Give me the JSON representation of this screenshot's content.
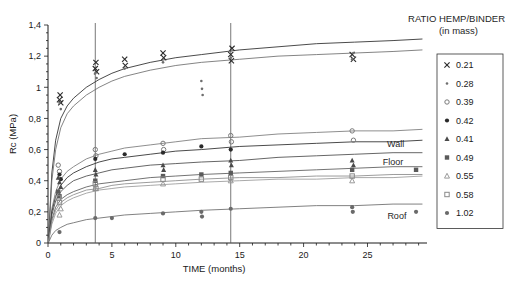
{
  "chart_data": {
    "type": "line",
    "title": "RATIO HEMP/BINDER",
    "subtitle": "(in mass)",
    "xlabel": "TIME (months)",
    "ylabel": "Rc (MPa)",
    "xlim": [
      0,
      29.5
    ],
    "ylim": [
      0,
      1.4
    ],
    "xticks": [
      0,
      5,
      10,
      15,
      20,
      25
    ],
    "xtick_labels": [
      "0",
      "5",
      "10",
      "15",
      "20",
      "25"
    ],
    "xtick_step_minor": 1,
    "yticks": [
      0,
      0.2,
      0.4,
      0.6,
      0.8,
      1.0,
      1.2,
      1.4
    ],
    "ytick_labels": [
      "0",
      "0,2",
      "0,4",
      "0,6",
      "0,8",
      "1",
      "1,2",
      "1,4"
    ],
    "grid": false,
    "legend_position": "right",
    "legend_title": "RATIO HEMP/BINDER (in mass)",
    "vertical_reference_lines": [
      3.7,
      14.3
    ],
    "annotations": [
      {
        "text": "Wall",
        "x": 27.2,
        "y": 0.615
      },
      {
        "text": "Floor",
        "x": 27.0,
        "y": 0.5
      },
      {
        "text": "Roof",
        "x": 27.3,
        "y": 0.155
      }
    ],
    "series": [
      {
        "name": "0.21",
        "marker": "cross",
        "color": "#2a2a2a",
        "curve": [
          [
            0.05,
            0.04
          ],
          [
            0.3,
            0.45
          ],
          [
            0.6,
            0.66
          ],
          [
            1.0,
            0.8
          ],
          [
            1.5,
            0.88
          ],
          [
            2,
            0.93
          ],
          [
            3,
            1.0
          ],
          [
            4,
            1.05
          ],
          [
            5,
            1.09
          ],
          [
            6,
            1.12
          ],
          [
            8,
            1.16
          ],
          [
            10,
            1.19
          ],
          [
            12,
            1.21
          ],
          [
            15,
            1.24
          ],
          [
            18,
            1.26
          ],
          [
            21,
            1.28
          ],
          [
            24,
            1.29
          ],
          [
            27,
            1.3
          ],
          [
            29.3,
            1.31
          ]
        ],
        "points": [
          [
            0.9,
            0.92
          ],
          [
            0.95,
            0.95
          ],
          [
            1.0,
            0.9
          ],
          [
            3.7,
            1.12
          ],
          [
            3.75,
            1.16
          ],
          [
            3.8,
            1.1
          ],
          [
            6.0,
            1.18
          ],
          [
            6.05,
            1.14
          ],
          [
            9.0,
            1.22
          ],
          [
            9.05,
            1.19
          ],
          [
            14.3,
            1.21
          ],
          [
            14.35,
            1.17
          ],
          [
            14.4,
            1.25
          ],
          [
            23.8,
            1.21
          ],
          [
            23.9,
            1.18
          ]
        ]
      },
      {
        "name": "0.28",
        "marker": "dot-small",
        "color": "#6e6e6e",
        "curve": [
          [
            0.05,
            0.03
          ],
          [
            0.3,
            0.4
          ],
          [
            0.6,
            0.6
          ],
          [
            1.0,
            0.74
          ],
          [
            1.5,
            0.83
          ],
          [
            2,
            0.88
          ],
          [
            3,
            0.95
          ],
          [
            4,
            1.0
          ],
          [
            5,
            1.04
          ],
          [
            6,
            1.07
          ],
          [
            8,
            1.11
          ],
          [
            10,
            1.14
          ],
          [
            12,
            1.16
          ],
          [
            15,
            1.18
          ],
          [
            18,
            1.2
          ],
          [
            21,
            1.21
          ],
          [
            24,
            1.22
          ],
          [
            27,
            1.23
          ],
          [
            29.3,
            1.24
          ]
        ],
        "points": [
          [
            0.9,
            0.9
          ],
          [
            1.0,
            0.86
          ],
          [
            3.7,
            1.09
          ],
          [
            3.8,
            1.06
          ],
          [
            6.0,
            1.12
          ],
          [
            9.0,
            1.16
          ],
          [
            12.0,
            1.04
          ],
          [
            12.05,
            0.99
          ],
          [
            12.1,
            0.95
          ],
          [
            14.3,
            1.19
          ],
          [
            23.8,
            1.18
          ],
          [
            23.9,
            1.22
          ]
        ]
      },
      {
        "name": "0.39",
        "marker": "circle-open",
        "color": "#7a7a7a",
        "curve": [
          [
            0.05,
            0.02
          ],
          [
            0.3,
            0.22
          ],
          [
            0.6,
            0.33
          ],
          [
            1.0,
            0.41
          ],
          [
            1.5,
            0.46
          ],
          [
            2,
            0.49
          ],
          [
            3,
            0.54
          ],
          [
            4,
            0.57
          ],
          [
            5,
            0.59
          ],
          [
            6,
            0.61
          ],
          [
            8,
            0.63
          ],
          [
            10,
            0.65
          ],
          [
            12,
            0.67
          ],
          [
            15,
            0.68
          ],
          [
            18,
            0.7
          ],
          [
            21,
            0.71
          ],
          [
            24,
            0.72
          ],
          [
            27,
            0.72
          ],
          [
            29.3,
            0.73
          ]
        ],
        "points": [
          [
            0.8,
            0.5
          ],
          [
            0.9,
            0.46
          ],
          [
            3.7,
            0.6
          ],
          [
            3.75,
            0.56
          ],
          [
            9.0,
            0.64
          ],
          [
            9.05,
            0.6
          ],
          [
            14.3,
            0.69
          ],
          [
            14.35,
            0.65
          ],
          [
            23.8,
            0.72
          ],
          [
            23.9,
            0.66
          ]
        ]
      },
      {
        "name": "0.42",
        "marker": "dot-filled",
        "color": "#2a2a2a",
        "curve": [
          [
            0.05,
            0.02
          ],
          [
            0.3,
            0.2
          ],
          [
            0.6,
            0.3
          ],
          [
            1.0,
            0.37
          ],
          [
            1.5,
            0.42
          ],
          [
            2,
            0.45
          ],
          [
            3,
            0.49
          ],
          [
            4,
            0.52
          ],
          [
            5,
            0.54
          ],
          [
            6,
            0.55
          ],
          [
            8,
            0.57
          ],
          [
            10,
            0.59
          ],
          [
            12,
            0.6
          ],
          [
            15,
            0.62
          ],
          [
            18,
            0.63
          ],
          [
            21,
            0.64
          ],
          [
            24,
            0.65
          ],
          [
            27,
            0.65
          ],
          [
            29.3,
            0.66
          ]
        ],
        "points": [
          [
            0.9,
            0.44
          ],
          [
            1.0,
            0.41
          ],
          [
            3.7,
            0.54
          ],
          [
            6.0,
            0.57
          ],
          [
            9.0,
            0.58
          ],
          [
            12.0,
            0.62
          ],
          [
            14.3,
            0.6
          ]
        ]
      },
      {
        "name": "0.41",
        "marker": "triangle-filled",
        "color": "#4a4a4a",
        "curve": [
          [
            0.05,
            0.02
          ],
          [
            0.3,
            0.18
          ],
          [
            0.6,
            0.27
          ],
          [
            1.0,
            0.33
          ],
          [
            1.5,
            0.37
          ],
          [
            2,
            0.4
          ],
          [
            3,
            0.43
          ],
          [
            4,
            0.45
          ],
          [
            5,
            0.47
          ],
          [
            6,
            0.48
          ],
          [
            8,
            0.5
          ],
          [
            10,
            0.51
          ],
          [
            12,
            0.52
          ],
          [
            15,
            0.53
          ],
          [
            18,
            0.55
          ],
          [
            21,
            0.56
          ],
          [
            24,
            0.57
          ],
          [
            27,
            0.58
          ],
          [
            29.3,
            0.58
          ]
        ],
        "points": [
          [
            0.8,
            0.42
          ],
          [
            0.9,
            0.39
          ],
          [
            1.0,
            0.36
          ],
          [
            3.7,
            0.47
          ],
          [
            3.75,
            0.44
          ],
          [
            9.0,
            0.5
          ],
          [
            9.05,
            0.47
          ],
          [
            14.3,
            0.53
          ],
          [
            14.35,
            0.5
          ],
          [
            23.8,
            0.53
          ],
          [
            23.9,
            0.5
          ]
        ]
      },
      {
        "name": "0.49",
        "marker": "square-filled",
        "color": "#5a5a5a",
        "curve": [
          [
            0.05,
            0.015
          ],
          [
            0.3,
            0.15
          ],
          [
            0.6,
            0.23
          ],
          [
            1.0,
            0.28
          ],
          [
            1.5,
            0.31
          ],
          [
            2,
            0.33
          ],
          [
            3,
            0.36
          ],
          [
            4,
            0.38
          ],
          [
            5,
            0.39
          ],
          [
            6,
            0.4
          ],
          [
            8,
            0.42
          ],
          [
            10,
            0.43
          ],
          [
            12,
            0.44
          ],
          [
            15,
            0.45
          ],
          [
            18,
            0.46
          ],
          [
            21,
            0.47
          ],
          [
            24,
            0.48
          ],
          [
            27,
            0.49
          ],
          [
            29.3,
            0.49
          ]
        ],
        "points": [
          [
            0.8,
            0.33
          ],
          [
            0.9,
            0.3
          ],
          [
            3.7,
            0.4
          ],
          [
            9.0,
            0.43
          ],
          [
            12.0,
            0.44
          ],
          [
            14.3,
            0.45
          ],
          [
            23.8,
            0.47
          ],
          [
            28.8,
            0.47
          ]
        ]
      },
      {
        "name": "0.55",
        "marker": "triangle-open",
        "color": "#9a9a9a",
        "curve": [
          [
            0.05,
            0.01
          ],
          [
            0.3,
            0.12
          ],
          [
            0.6,
            0.19
          ],
          [
            1.0,
            0.24
          ],
          [
            1.5,
            0.27
          ],
          [
            2,
            0.29
          ],
          [
            3,
            0.32
          ],
          [
            4,
            0.34
          ],
          [
            5,
            0.35
          ],
          [
            6,
            0.36
          ],
          [
            8,
            0.37
          ],
          [
            10,
            0.38
          ],
          [
            12,
            0.39
          ],
          [
            15,
            0.4
          ],
          [
            18,
            0.41
          ],
          [
            21,
            0.41
          ],
          [
            24,
            0.42
          ],
          [
            27,
            0.42
          ],
          [
            29.3,
            0.43
          ]
        ],
        "points": [
          [
            0.9,
            0.18
          ],
          [
            1.0,
            0.22
          ],
          [
            3.7,
            0.35
          ],
          [
            9.0,
            0.38
          ],
          [
            14.3,
            0.4
          ],
          [
            23.8,
            0.4
          ]
        ]
      },
      {
        "name": "0.58",
        "marker": "square-open",
        "color": "#8a8a8a",
        "curve": [
          [
            0.05,
            0.012
          ],
          [
            0.3,
            0.14
          ],
          [
            0.6,
            0.21
          ],
          [
            1.0,
            0.26
          ],
          [
            1.5,
            0.29
          ],
          [
            2,
            0.31
          ],
          [
            3,
            0.34
          ],
          [
            4,
            0.35
          ],
          [
            5,
            0.37
          ],
          [
            6,
            0.38
          ],
          [
            8,
            0.39
          ],
          [
            10,
            0.4
          ],
          [
            12,
            0.41
          ],
          [
            15,
            0.42
          ],
          [
            18,
            0.42
          ],
          [
            21,
            0.43
          ],
          [
            24,
            0.43
          ],
          [
            27,
            0.44
          ],
          [
            29.3,
            0.44
          ]
        ],
        "points": [
          [
            0.8,
            0.29
          ],
          [
            0.9,
            0.26
          ],
          [
            3.7,
            0.38
          ],
          [
            3.75,
            0.35
          ],
          [
            9.0,
            0.41
          ],
          [
            12.0,
            0.41
          ],
          [
            14.3,
            0.42
          ],
          [
            23.8,
            0.43
          ]
        ]
      },
      {
        "name": "1.02",
        "marker": "dot-filled",
        "color": "#6a6a6a",
        "curve": [
          [
            0.05,
            0.005
          ],
          [
            0.3,
            0.05
          ],
          [
            0.6,
            0.08
          ],
          [
            1.0,
            0.1
          ],
          [
            1.5,
            0.12
          ],
          [
            2,
            0.13
          ],
          [
            3,
            0.15
          ],
          [
            4,
            0.16
          ],
          [
            5,
            0.17
          ],
          [
            6,
            0.18
          ],
          [
            8,
            0.19
          ],
          [
            10,
            0.2
          ],
          [
            12,
            0.21
          ],
          [
            15,
            0.22
          ],
          [
            18,
            0.23
          ],
          [
            21,
            0.24
          ],
          [
            24,
            0.24
          ],
          [
            27,
            0.25
          ],
          [
            29.3,
            0.25
          ]
        ],
        "points": [
          [
            0.9,
            0.07
          ],
          [
            3.7,
            0.16
          ],
          [
            5.0,
            0.16
          ],
          [
            9.0,
            0.19
          ],
          [
            12.0,
            0.2
          ],
          [
            12.05,
            0.17
          ],
          [
            14.3,
            0.22
          ],
          [
            23.8,
            0.23
          ],
          [
            23.85,
            0.2
          ],
          [
            28.8,
            0.2
          ]
        ]
      }
    ]
  }
}
